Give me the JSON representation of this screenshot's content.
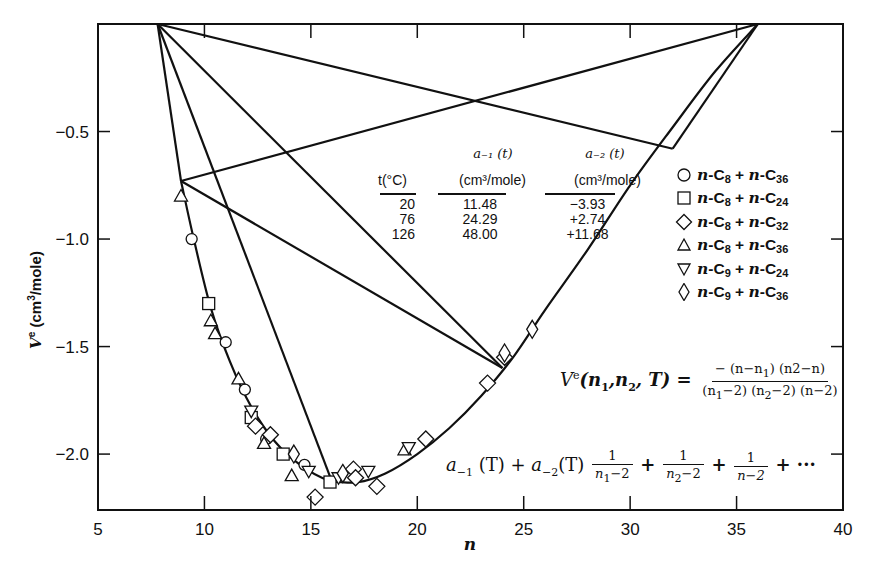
{
  "chart_data": {
    "type": "scatter",
    "title": "",
    "xlabel": "n",
    "ylabel": "V e (cm3/mole)",
    "xlim": [
      5,
      40
    ],
    "ylim": [
      -2.26,
      0.0
    ],
    "grid": false,
    "x_ticks": [
      5,
      10,
      15,
      20,
      25,
      30,
      35,
      40
    ],
    "x_tick_labels": [
      "5",
      "10",
      "15",
      "20",
      "25",
      "30",
      "35",
      "40"
    ],
    "y_ticks": [
      -0.5,
      -1.0,
      -1.5,
      -2.0
    ],
    "y_tick_labels": [
      "-0.5",
      "-1.0",
      "-1.5",
      "-2.0"
    ],
    "legend_position": "right",
    "series": [
      {
        "name": "n-C8 + n-C36",
        "marker": "circle",
        "points": [
          [
            9.4,
            -1.0
          ],
          [
            11.0,
            -1.48
          ],
          [
            11.9,
            -1.7
          ],
          [
            12.9,
            -1.93
          ],
          [
            14.7,
            -2.05
          ]
        ]
      },
      {
        "name": "n-C8 + n-C24",
        "marker": "square",
        "points": [
          [
            10.2,
            -1.3
          ],
          [
            12.2,
            -1.83
          ],
          [
            13.7,
            -2.0
          ],
          [
            15.9,
            -2.13
          ]
        ]
      },
      {
        "name": "n-C8 + n-C32",
        "marker": "diamond",
        "points": [
          [
            12.4,
            -1.87
          ],
          [
            13.1,
            -1.91
          ],
          [
            15.2,
            -2.2
          ],
          [
            17.0,
            -2.07
          ],
          [
            17.1,
            -2.11
          ],
          [
            18.1,
            -2.15
          ],
          [
            20.4,
            -1.93
          ],
          [
            23.3,
            -1.67
          ],
          [
            24.1,
            -1.55
          ]
        ]
      },
      {
        "name": "n-C8 + n-C36",
        "marker": "triangle-up",
        "points": [
          [
            8.9,
            -0.8
          ],
          [
            10.3,
            -1.38
          ],
          [
            10.5,
            -1.44
          ],
          [
            11.6,
            -1.65
          ],
          [
            12.8,
            -1.95
          ],
          [
            14.1,
            -2.1
          ],
          [
            19.4,
            -1.98
          ]
        ]
      },
      {
        "name": "n-C9 + n-C24",
        "marker": "triangle-down",
        "points": [
          [
            12.2,
            -1.8
          ],
          [
            14.9,
            -2.08
          ],
          [
            16.3,
            -2.11
          ],
          [
            17.7,
            -2.08
          ],
          [
            19.6,
            -1.97
          ]
        ]
      },
      {
        "name": "n-C9 + n-C36",
        "marker": "tall-diamond",
        "points": [
          [
            14.2,
            -2.0
          ],
          [
            16.5,
            -2.09
          ],
          [
            24.1,
            -1.53
          ],
          [
            25.4,
            -1.42
          ]
        ]
      }
    ],
    "fit_curve": {
      "description": "smooth V^e(n) curve through data",
      "points": [
        [
          8.9,
          -0.73
        ],
        [
          9.5,
          -1.0
        ],
        [
          10.3,
          -1.32
        ],
        [
          11.2,
          -1.57
        ],
        [
          12.2,
          -1.78
        ],
        [
          13.3,
          -1.94
        ],
        [
          14.5,
          -2.05
        ],
        [
          15.8,
          -2.12
        ],
        [
          17.2,
          -2.13
        ],
        [
          18.5,
          -2.09
        ],
        [
          20.0,
          -2.0
        ],
        [
          21.5,
          -1.88
        ],
        [
          23.0,
          -1.73
        ],
        [
          24.5,
          -1.55
        ],
        [
          26.0,
          -1.33
        ],
        [
          28.0,
          -1.05
        ],
        [
          30.0,
          -0.75
        ],
        [
          32.0,
          -0.48
        ],
        [
          34.0,
          -0.22
        ],
        [
          36.0,
          0.0
        ]
      ]
    },
    "construction_lines": [
      [
        [
          7.8,
          0.0
        ],
        [
          32.0,
          -0.58
        ]
      ],
      [
        [
          7.8,
          0.0
        ],
        [
          24.0,
          -1.6
        ]
      ],
      [
        [
          7.8,
          0.0
        ],
        [
          16.0,
          -2.13
        ]
      ],
      [
        [
          7.8,
          0.0
        ],
        [
          8.9,
          -0.73
        ]
      ],
      [
        [
          8.9,
          -0.73
        ],
        [
          36.0,
          0.0
        ]
      ],
      [
        [
          8.9,
          -0.73
        ],
        [
          24.0,
          -1.6
        ]
      ],
      [
        [
          32.0,
          -0.58
        ],
        [
          36.0,
          0.0
        ]
      ]
    ],
    "annotations": [
      "V^e(n1,n2,T) = -(n-n1)(n2-n)/((n1-2)(n2-2)(n-2))",
      "a_-1(T) + a_-2(T) 1/(n1-2) + 1/(n2-2) + 1/(n-2) + ..."
    ],
    "inset_table": {
      "columns": [
        "t(°C)",
        "a-1(t) (cm3/mole)",
        "a-2(t) (cm3/mole)"
      ],
      "rows": [
        [
          "20",
          "11.48",
          "-3.93"
        ],
        [
          "76",
          "24.29",
          "+2.74"
        ],
        [
          "126",
          "48.00",
          "+11.68"
        ]
      ]
    }
  },
  "axes": {
    "x_title": "n",
    "y_title_main": "V",
    "y_title_sup": "e",
    "y_title_rest": " (cm",
    "y_title_sup3": "3",
    "y_title_end": "/mole)",
    "x_tick_labels": [
      "5",
      "10",
      "15",
      "20",
      "25",
      "30",
      "35",
      "40"
    ],
    "y_tick_labels": [
      "−0.5",
      "−1.0",
      "−1.5",
      "−2.0"
    ]
  },
  "table": {
    "h_t_top": "",
    "h_t": "t(°C)",
    "h_a1_top": "a₋₁ (t)",
    "h_a1": "(cm³/mole)",
    "h_a2_top": "a₋₂ (t)",
    "h_a2": "(cm³/mole)",
    "col_t": [
      "20",
      "76",
      "126"
    ],
    "col_a1": [
      "11.48",
      "24.29",
      "48.00"
    ],
    "col_a2": [
      "−3.93",
      "+2.74",
      "+11.68"
    ]
  },
  "legend": [
    {
      "symbol": "circle",
      "pre": "n",
      "a": "-C",
      "sa": "8",
      "plus": " + ",
      "b_pre": "n",
      "b": "-C",
      "sb": "36"
    },
    {
      "symbol": "square",
      "pre": "n",
      "a": "-C",
      "sa": "8",
      "plus": " + ",
      "b_pre": "n",
      "b": "-C",
      "sb": "24"
    },
    {
      "symbol": "diamond",
      "pre": "n",
      "a": "-C",
      "sa": "8",
      "plus": " + ",
      "b_pre": "n",
      "b": "-C",
      "sb": "32"
    },
    {
      "symbol": "triangle-up",
      "pre": "n",
      "a": "-C",
      "sa": "8",
      "plus": " + ",
      "b_pre": "n",
      "b": "-C",
      "sb": "36"
    },
    {
      "symbol": "triangle-down",
      "pre": "n",
      "a": "-C",
      "sa": "9",
      "plus": " + ",
      "b_pre": "n",
      "b": "-C",
      "sb": "24"
    },
    {
      "symbol": "tall-diamond",
      "pre": "n",
      "a": "-C",
      "sa": "9",
      "plus": " + ",
      "b_pre": "n",
      "b": "-C",
      "sb": "36"
    }
  ],
  "equation1": {
    "lhs_v": "V",
    "lhs_sup": "e",
    "lhs_args_a": "(n",
    "lhs_sub1": "1",
    "lhs_args_b": ",n",
    "lhs_sub2": "2",
    "lhs_args_c": ", T) =",
    "num": "− (n−n",
    "num_sub": "1",
    "num_end": ") (n2−n)",
    "den_a": "(n",
    "den_sub1": "1",
    "den_b": "−2) (n",
    "den_sub2": "2",
    "den_c": "−2) (n−2)"
  },
  "equation2": {
    "a1": "a",
    "a1_sub": "−1",
    "a1_rest": " (T) + ",
    "a2": "a",
    "a2_sub": "−2",
    "a2_rest": "(T)",
    "f1_num": "1",
    "f1_den_a": "n",
    "f1_den_sub": "1",
    "f1_den_b": "−2",
    "plus": "+",
    "f2_num": "1",
    "f2_den_a": "n",
    "f2_den_sub": "2",
    "f2_den_b": "−2",
    "f3_num": "1",
    "f3_den": "n−2",
    "tail": "+ ···"
  }
}
